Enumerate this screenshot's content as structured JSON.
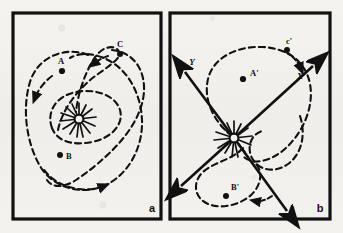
{
  "figure": {
    "background_color": "#f2f1ee",
    "ink_color": "#111111",
    "panel_border_color": "#111111"
  },
  "panels": [
    {
      "id": "a",
      "label": "a",
      "description": "Looping orbital trajectories around a central star, with marked positions A, B and C",
      "center_symbol": "starburst-sun",
      "points": [
        {
          "name": "A",
          "label": "A"
        },
        {
          "name": "B",
          "label": "B"
        },
        {
          "name": "C",
          "label": "C"
        }
      ],
      "axes": []
    },
    {
      "id": "b",
      "label": "b",
      "description": "Same trajectories referred to a rotated X-Y axis frame centred on the star, with marked positions A-prime, B-prime and c-prime",
      "center_symbol": "starburst-sun",
      "points": [
        {
          "name": "A-prime",
          "label": "A'"
        },
        {
          "name": "B-prime",
          "label": "B'"
        },
        {
          "name": "c-prime",
          "label": "c'"
        }
      ],
      "axes": [
        {
          "name": "x-axis",
          "label": "X"
        },
        {
          "name": "y-axis",
          "label": "Y"
        }
      ]
    }
  ],
  "style_tokens": {
    "orbit_stroke": "#111111",
    "orbit_dash": "6 4",
    "axis_stroke": "#111111"
  }
}
